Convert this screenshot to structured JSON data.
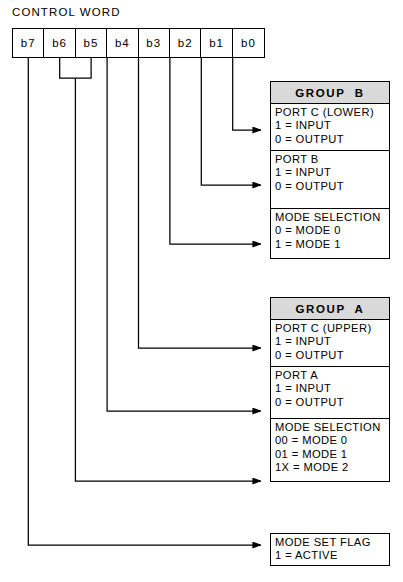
{
  "control_word": {
    "title": "CONTROL WORD",
    "bits": [
      "b7",
      "b6",
      "b5",
      "b4",
      "b3",
      "b2",
      "b1",
      "b0"
    ]
  },
  "group_b": {
    "header": "GROUP  B",
    "sections": [
      {
        "title": "PORT C (LOWER)",
        "lines": [
          "1 = INPUT",
          "0 = OUTPUT"
        ]
      },
      {
        "title": "PORT B",
        "lines": [
          "1 = INPUT",
          "0 = OUTPUT"
        ]
      },
      {
        "title": "MODE SELECTION",
        "lines": [
          "0 = MODE 0",
          "1 = MODE 1"
        ]
      }
    ]
  },
  "group_a": {
    "header": "GROUP  A",
    "sections": [
      {
        "title": "PORT C (UPPER)",
        "lines": [
          "1 = INPUT",
          "0 = OUTPUT"
        ]
      },
      {
        "title": "PORT A",
        "lines": [
          "1 = INPUT",
          "0 = OUTPUT"
        ]
      },
      {
        "title": "MODE SELECTION",
        "lines": [
          "00 = MODE 0",
          "01 = MODE 1",
          "1X = MODE 2"
        ]
      }
    ]
  },
  "mode_set_flag": {
    "title": "MODE SET FLAG",
    "lines": [
      "1 = ACTIVE"
    ]
  },
  "colors": {
    "line": "#000000",
    "header_fill": "#d9d9d9",
    "background": "#ffffff"
  }
}
